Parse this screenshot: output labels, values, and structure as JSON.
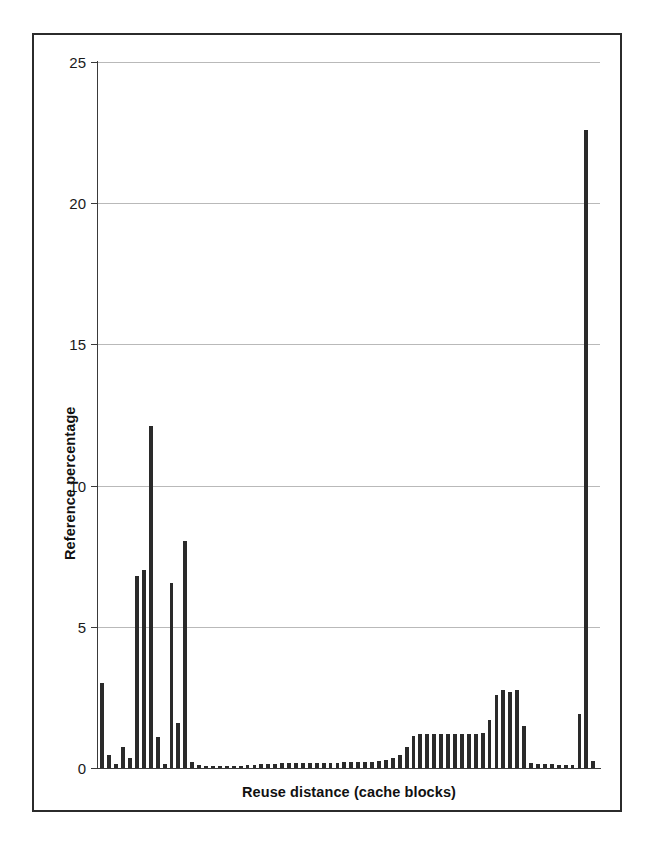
{
  "figure": {
    "frame_color": "#2b2b2b",
    "background": "#ffffff"
  },
  "chart_data": {
    "type": "bar",
    "title": "",
    "subtitle": "",
    "xlabel": "Reuse distance (cache blocks)",
    "ylabel": "Reference percentage",
    "ylim": [
      0,
      25
    ],
    "yticks": [
      0,
      5,
      10,
      15,
      20,
      25
    ],
    "ytick_labels": [
      "0",
      "5",
      "10",
      "15",
      "20",
      "25"
    ],
    "grid": "horizontal",
    "legend": "none",
    "bar_color": "#2a2a2a",
    "grid_color": "#b9b9b9",
    "axis_color": "#3a3a3a",
    "xtick_labels": [],
    "bin_count": 72,
    "values": [
      3.0,
      0.45,
      0.15,
      0.75,
      0.35,
      6.8,
      7.0,
      12.1,
      1.1,
      0.15,
      6.55,
      1.6,
      8.05,
      0.2,
      0.1,
      0.08,
      0.08,
      0.07,
      0.07,
      0.07,
      0.08,
      0.1,
      0.12,
      0.14,
      0.15,
      0.15,
      0.16,
      0.16,
      0.17,
      0.17,
      0.18,
      0.18,
      0.18,
      0.19,
      0.19,
      0.2,
      0.2,
      0.2,
      0.21,
      0.22,
      0.25,
      0.3,
      0.35,
      0.45,
      0.75,
      1.15,
      1.2,
      1.2,
      1.2,
      1.2,
      1.2,
      1.2,
      1.2,
      1.2,
      1.2,
      1.25,
      1.7,
      2.6,
      2.75,
      2.7,
      2.75,
      1.5,
      0.18,
      0.15,
      0.14,
      0.13,
      0.12,
      0.12,
      0.12,
      1.9,
      22.6,
      0.25
    ]
  }
}
